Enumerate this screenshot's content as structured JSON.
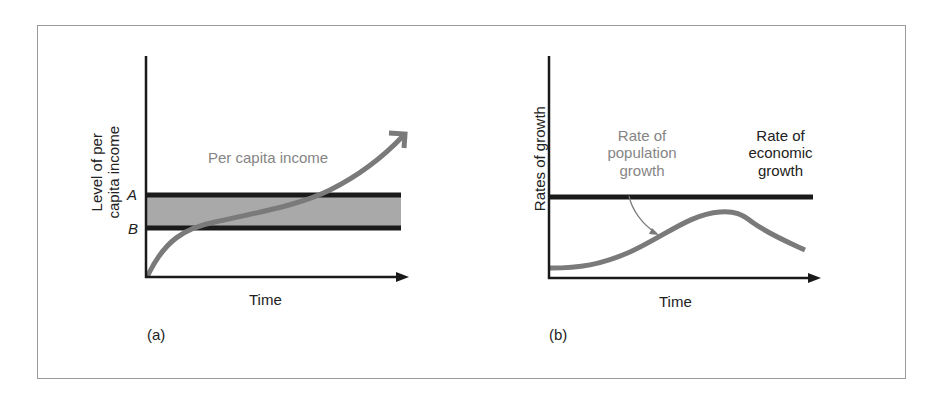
{
  "colors": {
    "axis": "#1a1a1a",
    "band_fill": "#a9a9a9",
    "curve": "#7a7a7a",
    "frame": "#9a9a9a",
    "gray_text": "#858585"
  },
  "panel_a": {
    "tag": "(a)",
    "y_label_line1": "Level of per",
    "y_label_line2": "capita income",
    "x_label": "Time",
    "level_a": "A",
    "level_b": "B",
    "curve_label": "Per capita income"
  },
  "panel_b": {
    "tag": "(b)",
    "y_label": "Rates of growth",
    "x_label": "Time",
    "population_label_line1": "Rate of",
    "population_label_line2": "population",
    "population_label_line3": "growth",
    "economic_label_line1": "Rate of",
    "economic_label_line2": "economic",
    "economic_label_line3": "growth"
  }
}
